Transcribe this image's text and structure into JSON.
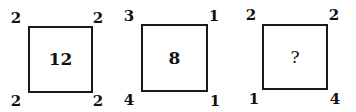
{
  "puzzle": {
    "figures": [
      {
        "center": "12",
        "corners": {
          "top_left": "2",
          "top_right": "2",
          "bottom_left": "2",
          "bottom_right": "2"
        }
      },
      {
        "center": "8",
        "corners": {
          "top_left": "3",
          "top_right": "1",
          "bottom_left": "4",
          "bottom_right": "1"
        }
      },
      {
        "center": "?",
        "corners": {
          "top_left": "2",
          "top_right": "2",
          "bottom_left": "1",
          "bottom_right": "4"
        }
      }
    ]
  }
}
